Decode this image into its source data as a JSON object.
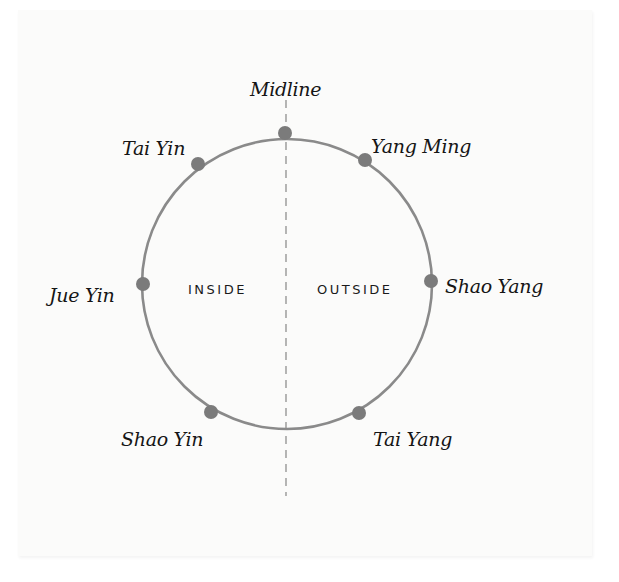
{
  "diagram": {
    "midline_label": "Midline",
    "regions": {
      "inside": "INSIDE",
      "outside": "OUTSIDE"
    },
    "nodes": [
      {
        "id": "top",
        "label": ""
      },
      {
        "id": "tai-yin",
        "label": "Tai Yin"
      },
      {
        "id": "yang-ming",
        "label": "Yang Ming"
      },
      {
        "id": "jue-yin",
        "label": "Jue Yin"
      },
      {
        "id": "shao-yang",
        "label": "Shao Yang"
      },
      {
        "id": "shao-yin",
        "label": "Shao Yin"
      },
      {
        "id": "tai-yang",
        "label": "Tai Yang"
      }
    ],
    "colors": {
      "circle": "#8a8a8a",
      "dot": "#7b7b7b",
      "midline": "#8f8f8f",
      "text": "#151515",
      "paper": "#fbfbfa"
    }
  }
}
